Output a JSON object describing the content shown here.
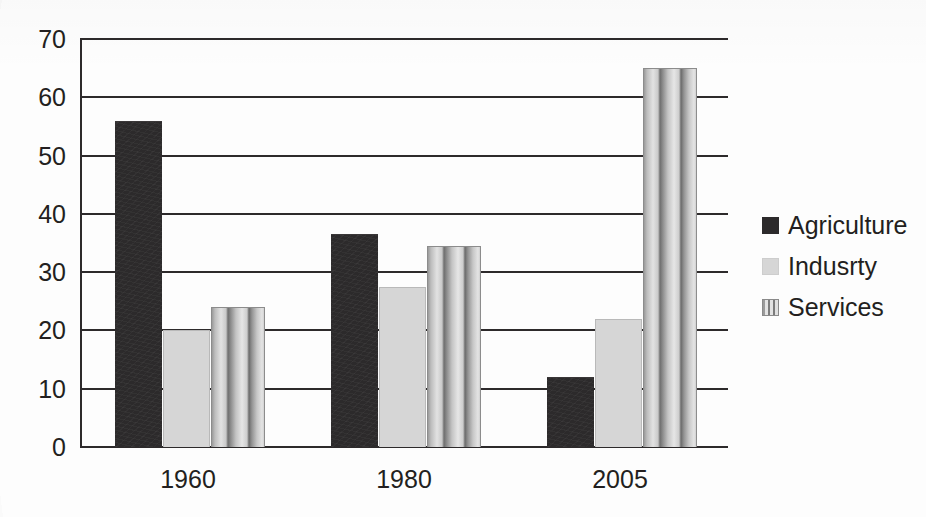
{
  "chart_data": {
    "type": "bar",
    "title": "",
    "subtitle": "",
    "xlabel": "",
    "ylabel": "",
    "categories": [
      "1960",
      "1980",
      "2005"
    ],
    "series": [
      {
        "name": "Agriculture",
        "values": [
          56,
          36.5,
          12
        ],
        "color": "#2c2a2b",
        "fill": "solid-dark"
      },
      {
        "name": "Indusrty",
        "values": [
          20,
          27.5,
          22
        ],
        "color": "#d6d6d6",
        "fill": "solid-light-gray"
      },
      {
        "name": "Services",
        "values": [
          24,
          34.5,
          65
        ],
        "color": "#bdbdbd",
        "fill": "vertical-stripes"
      }
    ],
    "ylim": [
      0,
      70
    ],
    "ytick_step": 10,
    "yticks": [
      70,
      60,
      50,
      40,
      30,
      20,
      10,
      0
    ],
    "grid": true,
    "grid_axis": "y",
    "legend": true,
    "legend_position": "right"
  },
  "axis": {
    "y_ticks": [
      "70",
      "60",
      "50",
      "40",
      "30",
      "20",
      "10",
      "0"
    ],
    "x_ticks": [
      "1960",
      "1980",
      "2005"
    ]
  },
  "legend": {
    "items": [
      {
        "label": "Agriculture",
        "swatch": "agriculture"
      },
      {
        "label": "Indusrty",
        "swatch": "industry"
      },
      {
        "label": "Services",
        "swatch": "services"
      }
    ]
  },
  "colors": {
    "agriculture": "#2c2a2b",
    "industry": "#d6d6d6",
    "services": "#bdbdbd",
    "axis": "#2d2a2b",
    "text": "#231f20",
    "background": "#fdfdfd"
  }
}
